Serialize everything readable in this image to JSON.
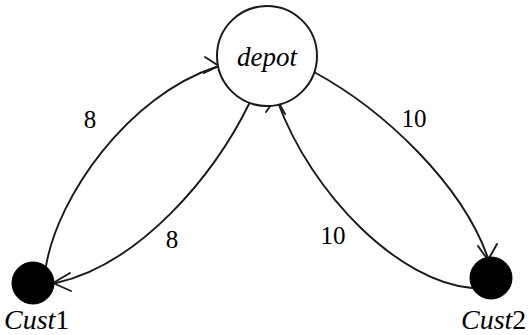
{
  "diagram": {
    "type": "directed-graph",
    "background_color": "#ffffff",
    "line_color": "#1a1a1a",
    "node_fill_depot": "#ffffff",
    "node_fill_customer": "#000000",
    "nodes": [
      {
        "id": "depot",
        "label": "depot",
        "shape": "circle-outline",
        "cx": 267,
        "cy": 56,
        "r": 50
      },
      {
        "id": "cust1",
        "label_italic": "Cust",
        "label_upright": "1",
        "shape": "filled-dot",
        "cx": 33,
        "cy": 283,
        "r": 21
      },
      {
        "id": "cust2",
        "label_italic": "Cust",
        "label_upright": "2",
        "shape": "filled-dot",
        "cx": 491,
        "cy": 278,
        "r": 21
      }
    ],
    "edges": [
      {
        "id": "cust1-to-depot",
        "from": "cust1",
        "to": "depot",
        "cost": "8",
        "label_x": 90,
        "label_y": 128
      },
      {
        "id": "depot-to-cust1",
        "from": "depot",
        "to": "cust1",
        "cost": "8",
        "label_x": 172,
        "label_y": 248
      },
      {
        "id": "depot-to-cust2",
        "from": "depot",
        "to": "cust2",
        "cost": "10",
        "label_x": 414,
        "label_y": 127
      },
      {
        "id": "cust2-to-depot",
        "from": "cust2",
        "to": "depot",
        "cost": "10",
        "label_x": 333,
        "label_y": 244
      }
    ]
  }
}
